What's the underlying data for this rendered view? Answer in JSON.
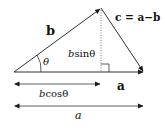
{
  "diagram": {
    "title": "",
    "labels": {
      "vector_b": "b",
      "angle": "θ",
      "height_prefix": "b",
      "height_suffix": "sinθ",
      "vector_c": "c = a−b",
      "vector_a": "a",
      "projection_prefix": "b",
      "projection_suffix": "cosθ",
      "length_a": "a"
    },
    "colors": {
      "line": "#1a1a1a",
      "dotted": "#555555",
      "background": "#ffffff"
    },
    "points": {
      "origin": [
        14,
        72
      ],
      "apex": [
        101,
        8
      ],
      "a_end": [
        144,
        72
      ],
      "foot": [
        101,
        72
      ]
    }
  }
}
